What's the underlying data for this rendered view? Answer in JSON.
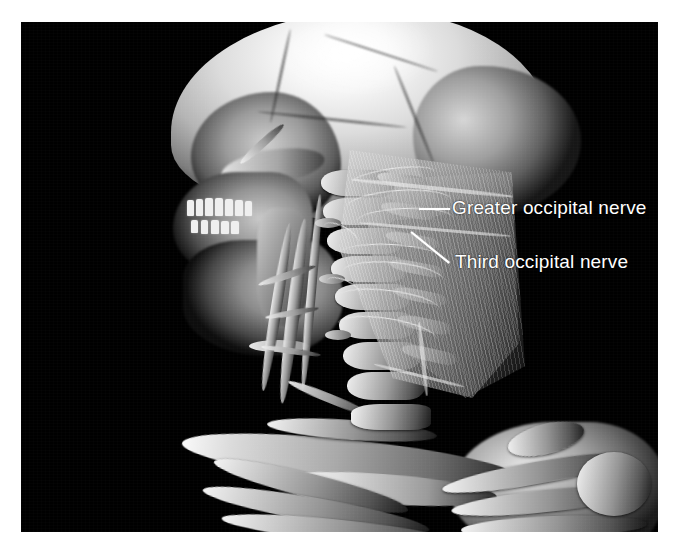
{
  "figure": {
    "modality": "3D CT volume rendering",
    "view": "lateral posterior oblique head and neck",
    "background_color": "#000000",
    "page_color": "#ffffff",
    "annotation_color": "#ffffff"
  },
  "annotations": [
    {
      "id": "greater-occipital-nerve",
      "label": "Greater occipital nerve",
      "leader": "horizontal",
      "label_x": 452,
      "label_y": 198
    },
    {
      "id": "third-occipital-nerve",
      "label": "Third occipital nerve",
      "leader": "diagonal",
      "label_x": 455,
      "label_y": 252
    }
  ],
  "anatomy": {
    "cranium": "calvaria",
    "occiput": "occipital bone",
    "face": "maxilla and mandible with dentition",
    "spine": "cervical vertebrae",
    "muscle": "posterior cervical muscle sheet",
    "girdle": "clavicle, sternum, scapula, ribs"
  }
}
